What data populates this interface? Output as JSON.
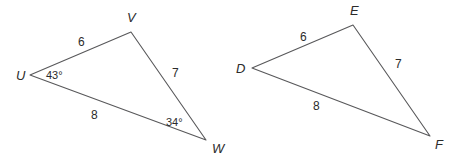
{
  "figure": {
    "background_color": "#ffffff",
    "stroke_color": "#58585a",
    "text_color": "#2b2b2b"
  },
  "triangles": [
    {
      "name": "triangle-uvw",
      "vertices": [
        {
          "label": "U",
          "x": 30,
          "y": 75,
          "label_x": 16,
          "label_y": 80
        },
        {
          "label": "V",
          "x": 131,
          "y": 32,
          "label_x": 127,
          "label_y": 22
        },
        {
          "label": "W",
          "x": 206,
          "y": 140,
          "label_x": 212,
          "label_y": 153
        }
      ],
      "sides": [
        {
          "label": "6",
          "from": "U",
          "to": "V",
          "label_x": 78,
          "label_y": 46
        },
        {
          "label": "7",
          "from": "V",
          "to": "W",
          "label_x": 172,
          "label_y": 77
        },
        {
          "label": "8",
          "from": "U",
          "to": "W",
          "label_x": 91,
          "label_y": 119
        }
      ],
      "angles": [
        {
          "label": "43°",
          "at": "U",
          "label_x": 46,
          "label_y": 79
        },
        {
          "label": "34°",
          "at": "W",
          "label_x": 166,
          "label_y": 126
        }
      ]
    },
    {
      "name": "triangle-def",
      "vertices": [
        {
          "label": "D",
          "x": 252,
          "y": 68,
          "label_x": 236,
          "label_y": 73
        },
        {
          "label": "E",
          "x": 353,
          "y": 25,
          "label_x": 350,
          "label_y": 15
        },
        {
          "label": "F",
          "x": 430,
          "y": 136,
          "label_x": 435,
          "label_y": 149
        }
      ],
      "sides": [
        {
          "label": "6",
          "from": "D",
          "to": "E",
          "label_x": 300,
          "label_y": 41
        },
        {
          "label": "7",
          "from": "E",
          "to": "F",
          "label_x": 395,
          "label_y": 68
        },
        {
          "label": "8",
          "from": "D",
          "to": "F",
          "label_x": 313,
          "label_y": 110
        }
      ],
      "angles": []
    }
  ]
}
